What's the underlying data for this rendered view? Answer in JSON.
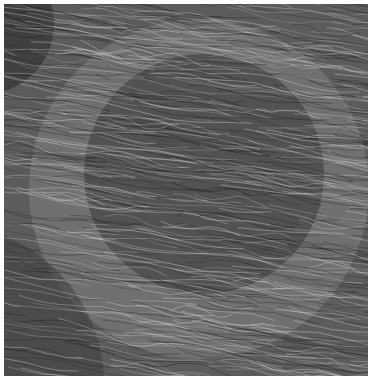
{
  "artwork": {
    "kind": "generative flow-line texture",
    "canvas": {
      "x": 4,
      "y": 4,
      "width": 364,
      "height": 372
    },
    "background_color": "#5c5c5c",
    "shapes": [
      {
        "type": "circle",
        "name": "large-light-circle",
        "cx": 195,
        "cy": 185,
        "r": 170,
        "fill": "#8a8a8a",
        "opacity": 0.45
      },
      {
        "type": "circle",
        "name": "dark-core",
        "cx": 200,
        "cy": 170,
        "r": 120,
        "fill": "#2e2e2e",
        "opacity": 0.45
      },
      {
        "type": "circle",
        "name": "lower-left-arc",
        "cx": -60,
        "cy": 380,
        "r": 160,
        "fill": "#3a3a3a",
        "opacity": 0.5
      },
      {
        "type": "circle",
        "name": "top-left-dark",
        "cx": -20,
        "cy": 20,
        "r": 70,
        "fill": "#2a2a2a",
        "opacity": 0.55
      }
    ],
    "strokes": {
      "count": 650,
      "light_color": "#d8d8d8",
      "dark_color": "#1c1c1c",
      "stroke_width": 0.7,
      "angle_deg": -8,
      "wave_amplitude": 3,
      "seed": 17
    }
  }
}
